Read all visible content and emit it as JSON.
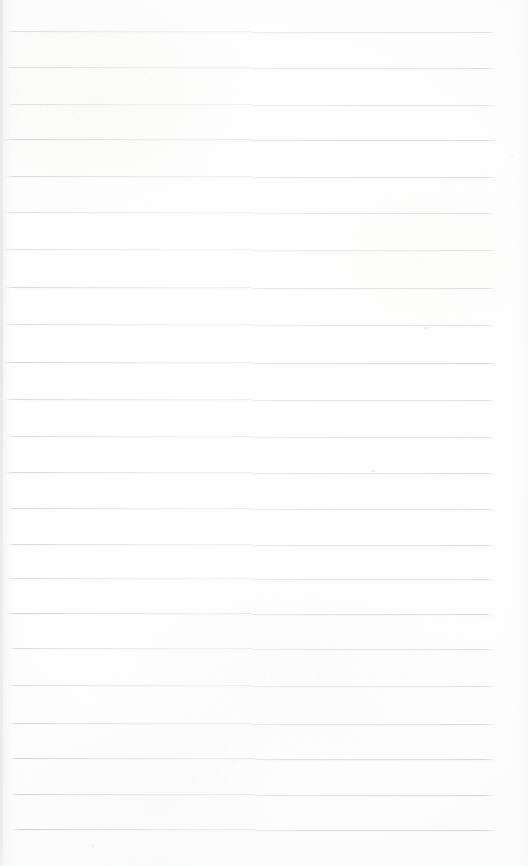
{
  "document": {
    "kind": "scanned-blank-ruled-page",
    "title": "Blank lined notebook page",
    "page_width": 528,
    "page_height": 866,
    "background_color": "#fefefe",
    "content_text": "",
    "has_handwriting": false,
    "has_printed_text": false
  },
  "ruling": {
    "style": "horizontal-ruled",
    "line_count": 23,
    "line_color": "#cfd3d6",
    "line_color_dark": "#bcc1c5",
    "line_color_light": "#e0e3e5",
    "line_thickness": 1,
    "average_spacing": 36,
    "first_line_y": 32,
    "last_line_y": 829,
    "left_margin_x": 5,
    "right_margin_x": 496,
    "slope_drop_px": 2,
    "lines": [
      {
        "index": 1,
        "y_left": 31,
        "y_right": 33,
        "x_start": 4,
        "x_end": 497,
        "weight": 0.55
      },
      {
        "index": 2,
        "y_left": 67,
        "y_right": 69,
        "x_start": 4,
        "x_end": 496,
        "weight": 0.6
      },
      {
        "index": 3,
        "y_left": 104,
        "y_right": 106,
        "x_start": 5,
        "x_end": 496,
        "weight": 0.5
      },
      {
        "index": 4,
        "y_left": 139,
        "y_right": 141,
        "x_start": 3,
        "x_end": 497,
        "weight": 0.72
      },
      {
        "index": 5,
        "y_left": 176,
        "y_right": 178,
        "x_start": 5,
        "x_end": 496,
        "weight": 0.68
      },
      {
        "index": 6,
        "y_left": 212,
        "y_right": 214,
        "x_start": 4,
        "x_end": 496,
        "weight": 0.55
      },
      {
        "index": 7,
        "y_left": 249,
        "y_right": 251,
        "x_start": 3,
        "x_end": 497,
        "weight": 0.5
      },
      {
        "index": 8,
        "y_left": 287,
        "y_right": 289,
        "x_start": 5,
        "x_end": 496,
        "weight": 0.66
      },
      {
        "index": 9,
        "y_left": 324,
        "y_right": 326,
        "x_start": 5,
        "x_end": 496,
        "weight": 0.58
      },
      {
        "index": 10,
        "y_left": 362,
        "y_right": 364,
        "x_start": 4,
        "x_end": 497,
        "weight": 0.74
      },
      {
        "index": 11,
        "y_left": 399,
        "y_right": 401,
        "x_start": 5,
        "x_end": 496,
        "weight": 0.64
      },
      {
        "index": 12,
        "y_left": 436,
        "y_right": 438,
        "x_start": 6,
        "x_end": 496,
        "weight": 0.62
      },
      {
        "index": 13,
        "y_left": 472,
        "y_right": 474,
        "x_start": 5,
        "x_end": 496,
        "weight": 0.7
      },
      {
        "index": 14,
        "y_left": 508,
        "y_right": 510,
        "x_start": 6,
        "x_end": 496,
        "weight": 0.66
      },
      {
        "index": 15,
        "y_left": 544,
        "y_right": 546,
        "x_start": 6,
        "x_end": 496,
        "weight": 0.68
      },
      {
        "index": 16,
        "y_left": 578,
        "y_right": 580,
        "x_start": 7,
        "x_end": 496,
        "weight": 0.6
      },
      {
        "index": 17,
        "y_left": 613,
        "y_right": 615,
        "x_start": 7,
        "x_end": 495,
        "weight": 0.74
      },
      {
        "index": 18,
        "y_left": 648,
        "y_right": 650,
        "x_start": 8,
        "x_end": 495,
        "weight": 0.62
      },
      {
        "index": 19,
        "y_left": 685,
        "y_right": 687,
        "x_start": 8,
        "x_end": 495,
        "weight": 0.6
      },
      {
        "index": 20,
        "y_left": 723,
        "y_right": 725,
        "x_start": 9,
        "x_end": 495,
        "weight": 0.68
      },
      {
        "index": 21,
        "y_left": 758,
        "y_right": 760,
        "x_start": 10,
        "x_end": 495,
        "weight": 0.76
      },
      {
        "index": 22,
        "y_left": 794,
        "y_right": 796,
        "x_start": 11,
        "x_end": 495,
        "weight": 0.74
      },
      {
        "index": 23,
        "y_left": 829,
        "y_right": 831,
        "x_start": 12,
        "x_end": 495,
        "weight": 0.78
      }
    ]
  },
  "artifacts": {
    "left_edge_shadow": true,
    "left_edge_shadow_width": 22,
    "right_edge_falloff": true,
    "bottom_edge_falloff": true,
    "specks": [
      {
        "x": 372,
        "y": 470,
        "size": 2.0,
        "color": "#b9bec2",
        "opacity": 0.55
      },
      {
        "x": 425,
        "y": 327,
        "size": 1.6,
        "color": "#c2c6ca",
        "opacity": 0.45
      },
      {
        "x": 418,
        "y": 512,
        "size": 1.4,
        "color": "#c6cacd",
        "opacity": 0.4
      },
      {
        "x": 92,
        "y": 845,
        "size": 2.2,
        "color": "#d2d5d8",
        "opacity": 0.4
      },
      {
        "x": 246,
        "y": 534,
        "size": 1.3,
        "color": "#cacdd0",
        "opacity": 0.35
      },
      {
        "x": 511,
        "y": 155,
        "size": 1.5,
        "color": "#d0d3d6",
        "opacity": 0.3
      }
    ]
  }
}
